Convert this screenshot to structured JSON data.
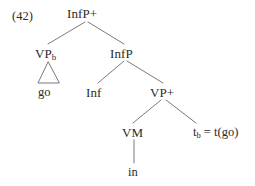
{
  "figure": {
    "example_number": "(42)",
    "type": "syntactic-tree-diagram",
    "colors": {
      "background": "#ffffff",
      "text": "#2b2b2b",
      "edge": "#6b6b6b"
    }
  },
  "tree": {
    "root": {
      "id": "InfP-plus",
      "label": "InfP+"
    },
    "nodes": [
      {
        "id": "InfP-plus",
        "label": "InfP+"
      },
      {
        "id": "VP-b",
        "label_main": "VP",
        "label_sub": "b"
      },
      {
        "id": "InfP",
        "label": "InfP"
      },
      {
        "id": "Inf",
        "label": "Inf"
      },
      {
        "id": "VP-plus",
        "label": "VP+"
      },
      {
        "id": "VM",
        "label": "VM"
      }
    ],
    "leaves": [
      {
        "id": "go",
        "label": "go"
      },
      {
        "id": "in",
        "label": "in"
      }
    ],
    "trace": {
      "id": "trace-b",
      "text_main": "t",
      "text_sub": "b",
      "text_rest": " = t(go)",
      "full": "t_b = t(go)"
    },
    "triangle": {
      "id": "vp-b-triangle",
      "dominates": "go",
      "meaning": "unexpanded-constituent"
    },
    "edges": [
      {
        "from": "InfP-plus",
        "to": "VP-b"
      },
      {
        "from": "InfP-plus",
        "to": "InfP"
      },
      {
        "from": "InfP",
        "to": "Inf"
      },
      {
        "from": "InfP",
        "to": "VP-plus"
      },
      {
        "from": "VP-plus",
        "to": "VM"
      },
      {
        "from": "VP-plus",
        "to": "trace-b"
      },
      {
        "from": "VM",
        "to": "in"
      }
    ]
  }
}
